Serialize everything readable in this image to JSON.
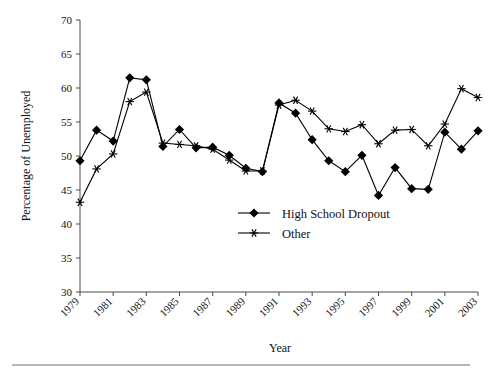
{
  "chart_data": {
    "type": "line",
    "title": "",
    "xlabel": "Year",
    "ylabel": "Percentage of Unemployed",
    "xlim": [
      1979,
      2003
    ],
    "ylim": [
      30,
      70
    ],
    "ytick_step": 5,
    "grid": false,
    "legend_position": "inside-center-bottom",
    "x": [
      1979,
      1980,
      1981,
      1982,
      1983,
      1984,
      1985,
      1986,
      1987,
      1988,
      1989,
      1990,
      1991,
      1992,
      1993,
      1994,
      1995,
      1996,
      1997,
      1998,
      1999,
      2000,
      2001,
      2002,
      2003
    ],
    "xticks": [
      1979,
      1981,
      1983,
      1985,
      1987,
      1989,
      1991,
      1993,
      1995,
      1997,
      1999,
      2001,
      2003
    ],
    "yticks": [
      30,
      35,
      40,
      45,
      50,
      55,
      60,
      65,
      70
    ],
    "series": [
      {
        "name": "High School Dropout",
        "marker": "diamond",
        "values": [
          49.3,
          53.8,
          52.2,
          61.5,
          61.2,
          51.4,
          53.9,
          51.2,
          51.3,
          50.1,
          48.2,
          47.7,
          57.8,
          56.3,
          52.4,
          49.3,
          47.7,
          50.1,
          44.2,
          48.3,
          45.2,
          45.1,
          53.5,
          51.0,
          53.7
        ]
      },
      {
        "name": "Other",
        "marker": "star",
        "values": [
          43.2,
          48.1,
          50.3,
          58.0,
          59.4,
          51.9,
          51.7,
          51.5,
          51.0,
          49.4,
          47.8,
          47.8,
          57.5,
          58.2,
          56.6,
          54.0,
          53.6,
          54.6,
          51.8,
          53.8,
          53.9,
          51.5,
          54.7,
          59.9,
          58.6
        ]
      }
    ]
  },
  "axes": {
    "y_title": "Percentage of Unemployed",
    "x_title": "Year"
  },
  "legend": {
    "items": [
      {
        "label": "High School Dropout",
        "marker": "diamond"
      },
      {
        "label": "Other",
        "marker": "star"
      }
    ]
  }
}
